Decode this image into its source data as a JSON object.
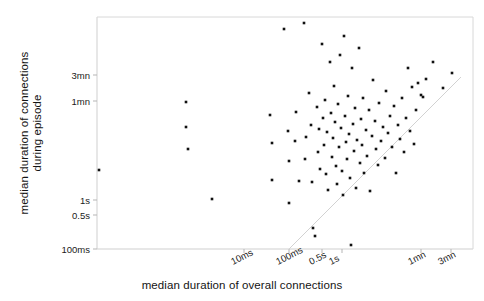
{
  "chart_data": {
    "type": "scatter",
    "title": "",
    "xlabel": "median duration of overall connections",
    "ylabel": "median duration of connections during episode",
    "xscale": "log",
    "yscale": "log",
    "grid": false,
    "legend": null,
    "xticklabels": [
      "10ms",
      "100ms",
      "0.5s",
      "1s",
      "1mn",
      "3mn"
    ],
    "yticklabels": [
      "3mn",
      "1mn",
      "1s",
      "0.5s",
      "100ms"
    ],
    "xtick_px": [
      244,
      289,
      322,
      342,
      421,
      451
    ],
    "ytick_px": [
      75,
      101,
      200,
      215,
      249
    ],
    "xlim_px": [
      97,
      473
    ],
    "ylim_px": [
      17,
      249
    ],
    "reference_line": {
      "name": "y = x diagonal",
      "x0_px": 288,
      "y0_px": 250,
      "x1_px": 461,
      "y1_px": 77
    },
    "marker": {
      "shape": "square",
      "size_px": 2.6,
      "color": "#111111"
    },
    "n_points": 104,
    "points_px": [
      [
        99,
        170
      ],
      [
        186,
        102
      ],
      [
        186,
        127
      ],
      [
        188,
        149
      ],
      [
        212,
        199
      ],
      [
        270,
        115
      ],
      [
        272,
        143
      ],
      [
        272,
        180
      ],
      [
        284,
        29
      ],
      [
        288,
        131
      ],
      [
        289,
        161
      ],
      [
        289,
        203
      ],
      [
        295,
        141
      ],
      [
        296,
        112
      ],
      [
        299,
        181
      ],
      [
        304,
        23
      ],
      [
        305,
        159
      ],
      [
        306,
        137
      ],
      [
        309,
        93
      ],
      [
        311,
        125
      ],
      [
        312,
        182
      ],
      [
        313,
        228
      ],
      [
        315,
        236
      ],
      [
        317,
        107
      ],
      [
        318,
        152
      ],
      [
        319,
        129
      ],
      [
        320,
        169
      ],
      [
        322,
        44
      ],
      [
        323,
        118
      ],
      [
        324,
        145
      ],
      [
        325,
        100
      ],
      [
        326,
        174
      ],
      [
        327,
        132
      ],
      [
        328,
        190
      ],
      [
        330,
        62
      ],
      [
        331,
        113
      ],
      [
        332,
        157
      ],
      [
        333,
        138
      ],
      [
        334,
        86
      ],
      [
        335,
        122
      ],
      [
        336,
        166
      ],
      [
        337,
        184
      ],
      [
        338,
        104
      ],
      [
        339,
        147
      ],
      [
        340,
        55
      ],
      [
        341,
        128
      ],
      [
        342,
        171
      ],
      [
        343,
        195
      ],
      [
        344,
        36
      ],
      [
        345,
        116
      ],
      [
        346,
        142
      ],
      [
        347,
        159
      ],
      [
        348,
        96
      ],
      [
        349,
        134
      ],
      [
        350,
        178
      ],
      [
        351,
        245
      ],
      [
        352,
        68
      ],
      [
        353,
        124
      ],
      [
        354,
        151
      ],
      [
        355,
        108
      ],
      [
        356,
        188
      ],
      [
        357,
        140
      ],
      [
        359,
        48
      ],
      [
        360,
        163
      ],
      [
        361,
        119
      ],
      [
        362,
        145
      ],
      [
        363,
        98
      ],
      [
        364,
        173
      ],
      [
        366,
        130
      ],
      [
        367,
        156
      ],
      [
        369,
        110
      ],
      [
        370,
        191
      ],
      [
        372,
        136
      ],
      [
        373,
        80
      ],
      [
        375,
        121
      ],
      [
        376,
        149
      ],
      [
        378,
        165
      ],
      [
        379,
        103
      ],
      [
        381,
        141
      ],
      [
        383,
        127
      ],
      [
        385,
        158
      ],
      [
        386,
        91
      ],
      [
        388,
        133
      ],
      [
        390,
        116
      ],
      [
        392,
        147
      ],
      [
        394,
        106
      ],
      [
        396,
        173
      ],
      [
        398,
        125
      ],
      [
        400,
        139
      ],
      [
        402,
        98
      ],
      [
        404,
        152
      ],
      [
        406,
        118
      ],
      [
        408,
        68
      ],
      [
        410,
        131
      ],
      [
        412,
        87
      ],
      [
        414,
        144
      ],
      [
        416,
        110
      ],
      [
        418,
        83
      ],
      [
        421,
        95
      ],
      [
        423,
        97
      ],
      [
        426,
        79
      ],
      [
        433,
        62
      ],
      [
        443,
        88
      ],
      [
        452,
        73
      ]
    ]
  }
}
